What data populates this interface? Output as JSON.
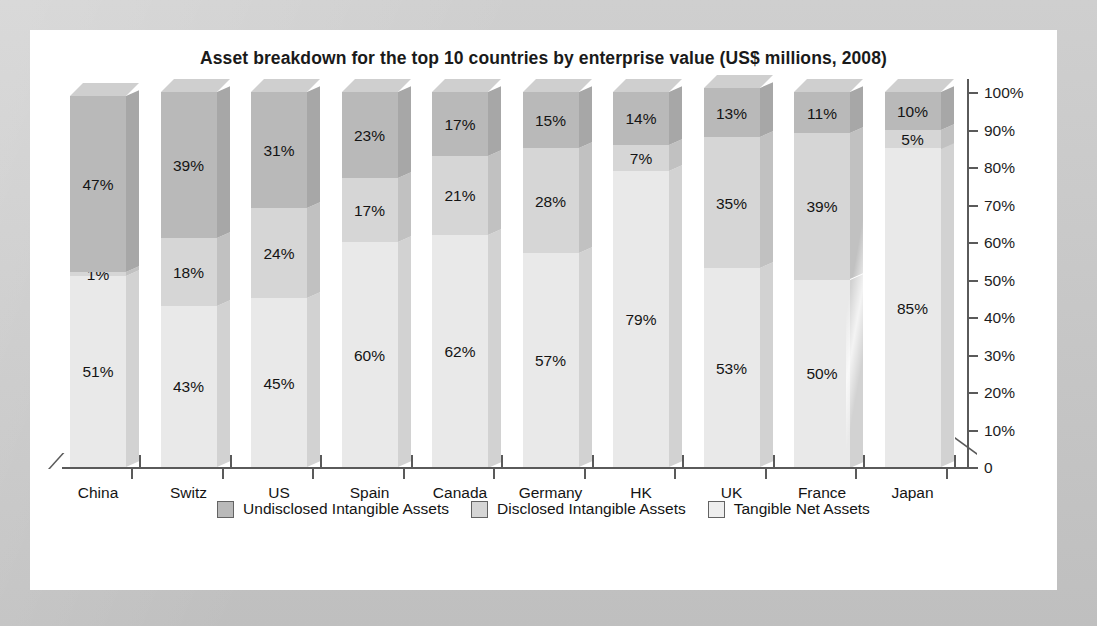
{
  "chart_data": {
    "type": "bar",
    "title": "Asset breakdown for the top 10 countries by enterprise value (US$ millions, 2008)",
    "subtitle": "",
    "xlabel": "",
    "ylabel": "",
    "stacked": true,
    "stack_order_bottom_to_top": [
      "Tangible Net Assets",
      "Disclosed Intangible Assets",
      "Undisclosed Intangible Assets"
    ],
    "categories": [
      "China",
      "Switz",
      "US",
      "Spain",
      "Canada",
      "Germany",
      "HK",
      "UK",
      "France",
      "Japan"
    ],
    "series": [
      {
        "name": "Tangible Net Assets",
        "color": "#e9e9e9",
        "values": [
          51,
          43,
          45,
          60,
          62,
          57,
          79,
          53,
          50,
          85
        ]
      },
      {
        "name": "Disclosed Intangible Assets",
        "color": "#d6d6d6",
        "values": [
          1,
          18,
          24,
          17,
          21,
          28,
          7,
          35,
          39,
          5
        ]
      },
      {
        "name": "Undisclosed Intangible Assets",
        "color": "#b9b9b9",
        "values": [
          47,
          39,
          31,
          23,
          17,
          15,
          14,
          13,
          11,
          10
        ]
      }
    ],
    "data_labels": {
      "China": {
        "tangible": "51%",
        "disclosed": "1%",
        "undisclosed": "47%"
      },
      "Switz": {
        "tangible": "43%",
        "disclosed": "18%",
        "undisclosed": "39%"
      },
      "US": {
        "tangible": "45%",
        "disclosed": "24%",
        "undisclosed": "31%"
      },
      "Spain": {
        "tangible": "60%",
        "disclosed": "17%",
        "undisclosed": "23%"
      },
      "Canada": {
        "tangible": "62%",
        "disclosed": "21%",
        "undisclosed": "17%"
      },
      "Germany": {
        "tangible": "57%",
        "disclosed": "28%",
        "undisclosed": "15%"
      },
      "HK": {
        "tangible": "79%",
        "disclosed": "7%",
        "undisclosed": "14%"
      },
      "UK": {
        "tangible": "53%",
        "disclosed": "35%",
        "undisclosed": "13%"
      },
      "France": {
        "tangible": "50%",
        "disclosed": "39%",
        "undisclosed": "11%"
      },
      "Japan": {
        "tangible": "85%",
        "disclosed": "5%",
        "undisclosed": "10%"
      }
    },
    "ylim": [
      0,
      100
    ],
    "yticks": [
      0,
      10,
      20,
      30,
      40,
      50,
      60,
      70,
      80,
      90,
      100
    ],
    "ytick_labels": [
      "0",
      "10%",
      "20%",
      "30%",
      "40%",
      "50%",
      "60%",
      "70%",
      "80%",
      "90%",
      "100%"
    ],
    "y_axis_position": "right",
    "grid": false,
    "legend_position": "bottom",
    "style_3d": true
  },
  "legend": {
    "items": [
      {
        "label": "Undisclosed Intangible Assets",
        "color": "#b9b9b9"
      },
      {
        "label": "Disclosed Intangible Assets",
        "color": "#d6d6d6"
      },
      {
        "label": "Tangible Net Assets",
        "color": "#eeeeee"
      }
    ]
  },
  "colors": {
    "page_background": "#c9c9c9",
    "panel_background": "#ffffff",
    "axis": "#5a5a5a",
    "text": "#141414",
    "undisclosed": "#b9b9b9",
    "disclosed": "#d6d6d6",
    "tangible": "#e9e9e9"
  }
}
